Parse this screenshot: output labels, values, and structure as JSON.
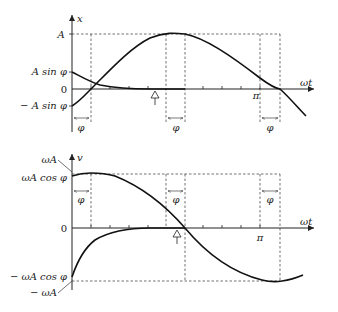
{
  "top_plot": {
    "y_axis_label": "x",
    "x_axis_label": "ωt",
    "y_labels": {
      "amplitude": "A",
      "a_sin_phi": "A  sin φ",
      "zero": "0",
      "neg_a_sin_phi": "− A  sin φ"
    },
    "pi_label": "π",
    "phi_labels": [
      "φ",
      "φ",
      "φ"
    ]
  },
  "bottom_plot": {
    "y_axis_label": "v",
    "x_axis_label": "ωt",
    "y_labels": {
      "omega_a": "ωA",
      "omega_a_cos_phi": "ωA  cos φ",
      "zero": "0",
      "neg_omega_a_cos_phi": "− ωA  cos φ",
      "neg_omega_a": "− ωA"
    },
    "pi_label": "π",
    "phi_labels": [
      "φ",
      "φ",
      "φ"
    ]
  }
}
